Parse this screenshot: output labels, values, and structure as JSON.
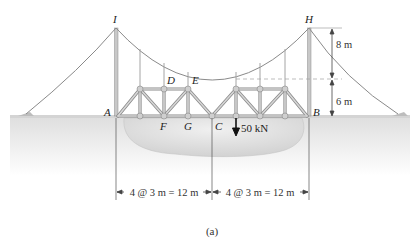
{
  "figure": {
    "caption": "(a)",
    "points": {
      "I": "I",
      "H": "H",
      "A": "A",
      "B": "B",
      "C": "C",
      "D": "D",
      "E": "E",
      "F": "F",
      "G": "G"
    },
    "dimensions": {
      "tower_upper": "8 m",
      "tower_lower": "6 m",
      "span_left": "4 @ 3 m = 12 m",
      "span_right": "4 @ 3 m = 12 m"
    },
    "load": {
      "label": "50 kN",
      "value_kN": 50,
      "direction": "down"
    },
    "colors": {
      "cable": "#8a8a8a",
      "truss": "#b8b8b8",
      "truss_edge": "#7a7a7a",
      "ground": "#e6e6e6",
      "water": "#dcdcdc",
      "text": "#222222"
    }
  }
}
